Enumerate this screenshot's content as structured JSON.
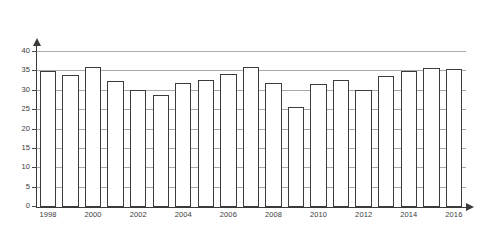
{
  "scan": {
    "top_strip_text": "",
    "background_color": "#ffffff",
    "ink_color": "#3b3b3b",
    "grid_color": "#9a9a9a"
  },
  "chart_data": {
    "type": "bar",
    "title": "",
    "subtitle": "",
    "xlabel": "",
    "ylabel": "",
    "ylim": [
      0,
      40
    ],
    "ytick_step": 5,
    "yticks": [
      0,
      5,
      10,
      15,
      20,
      25,
      30,
      35,
      40
    ],
    "ytick_labels": [
      "0",
      "5",
      "10",
      "15",
      "20",
      "25",
      "30",
      "35",
      "40"
    ],
    "grid": true,
    "grid_axis": "y",
    "legend": false,
    "legend_position": "none",
    "categories": [
      "1998",
      "1999",
      "2000",
      "2001",
      "2002",
      "2003",
      "2004",
      "2005",
      "2006",
      "2007",
      "2008",
      "2009",
      "2010",
      "2011",
      "2012",
      "2013",
      "2014",
      "2015",
      "2016"
    ],
    "xtick_labels_shown": [
      "1998",
      "2000",
      "2002",
      "2004",
      "2006",
      "2008",
      "2010",
      "2012",
      "2014",
      "2016"
    ],
    "xtick_label_interval": 2,
    "values": [
      34.9,
      34.0,
      36.0,
      32.5,
      30.0,
      28.9,
      31.8,
      32.6,
      34.2,
      36.1,
      31.9,
      25.8,
      31.6,
      32.7,
      30.2,
      33.6,
      35.0,
      35.7,
      35.5
    ],
    "series": [
      {
        "name": "",
        "values": [
          34.9,
          34.0,
          36.0,
          32.5,
          30.0,
          28.9,
          31.8,
          32.6,
          34.2,
          36.1,
          31.9,
          25.8,
          31.6,
          32.7,
          30.2,
          33.6,
          35.0,
          35.7,
          35.5
        ]
      }
    ],
    "bar_style": {
      "fill": "#ffffff",
      "edge": "#3b3b3b",
      "edge_width": 1.35
    }
  }
}
